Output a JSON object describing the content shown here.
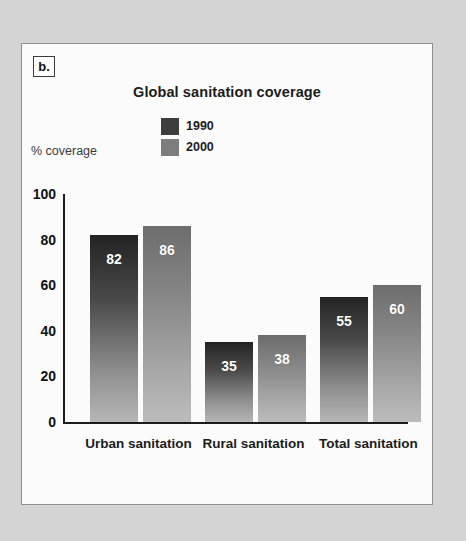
{
  "panel": {
    "letter": "b."
  },
  "chart_data": {
    "type": "bar",
    "title": "Global sanitation coverage",
    "xlabel": "",
    "ylabel": "% coverage",
    "ylim": [
      0,
      100
    ],
    "yticks": [
      0,
      20,
      40,
      60,
      80,
      100
    ],
    "grid": false,
    "legend_position": "top-center",
    "categories": [
      "Urban sanitation",
      "Rural sanitation",
      "Total sanitation"
    ],
    "series": [
      {
        "name": "1990",
        "color": "#3d3d3d",
        "values": [
          82,
          35,
          55
        ]
      },
      {
        "name": "2000",
        "color": "#7d7d7d",
        "values": [
          86,
          38,
          60
        ]
      }
    ]
  }
}
